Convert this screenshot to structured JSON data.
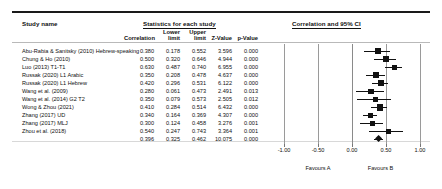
{
  "headings": {
    "study_name": "Study name",
    "statistics": "Statistics for each study",
    "forest": "Correlation and 95% CI"
  },
  "columns": {
    "correlation": "Correlation",
    "lower_line1": "Lower",
    "lower_line2": "limit",
    "upper_line1": "Upper",
    "upper_line2": "limit",
    "z_value": "Z-Value",
    "p_value": "p-Value"
  },
  "rows": [
    {
      "name": "Abu-Rabia & Sanitsky (2010) Hebrew-speaking",
      "correlation": "0.380",
      "lower": "0.178",
      "upper": "0.552",
      "z": "3.596",
      "p": "0.000",
      "point": 0.38,
      "lo": 0.178,
      "hi": 0.552,
      "weight": 0.62
    },
    {
      "name": "Chung & Ho (2010)",
      "correlation": "0.500",
      "lower": "0.320",
      "upper": "0.646",
      "z": "4.944",
      "p": "0.000",
      "point": 0.5,
      "lo": 0.32,
      "hi": 0.646,
      "weight": 0.55
    },
    {
      "name": "Luo (2013) T1-T1",
      "correlation": "0.630",
      "lower": "0.487",
      "upper": "0.740",
      "z": "6.955",
      "p": "0.000",
      "point": 0.63,
      "lo": 0.487,
      "hi": 0.74,
      "weight": 0.5
    },
    {
      "name": "Russak (2020) L1 Arabic",
      "correlation": "0.350",
      "lower": "0.208",
      "upper": "0.478",
      "z": "4.637",
      "p": "0.000",
      "point": 0.35,
      "lo": 0.208,
      "hi": 0.478,
      "weight": 0.78
    },
    {
      "name": "Russak (2020) L1 Hebrew",
      "correlation": "0.420",
      "lower": "0.296",
      "upper": "0.531",
      "z": "6.122",
      "p": "0.000",
      "point": 0.42,
      "lo": 0.296,
      "hi": 0.531,
      "weight": 0.85
    },
    {
      "name": "Wang et al. (2009)",
      "correlation": "0.280",
      "lower": "0.061",
      "upper": "0.473",
      "z": "2.491",
      "p": "0.013",
      "point": 0.28,
      "lo": 0.061,
      "hi": 0.473,
      "weight": 0.55
    },
    {
      "name": "Wang et al. (2014) G2 T2",
      "correlation": "0.350",
      "lower": "0.079",
      "upper": "0.573",
      "z": "2.505",
      "p": "0.012",
      "point": 0.35,
      "lo": 0.079,
      "hi": 0.573,
      "weight": 0.48
    },
    {
      "name": "Wong & Zhou (2021)",
      "correlation": "0.410",
      "lower": "0.284",
      "upper": "0.514",
      "z": "6.432",
      "p": "0.000",
      "point": 0.41,
      "lo": 0.284,
      "hi": 0.514,
      "weight": 0.92
    },
    {
      "name": "Zhang (2017) UD",
      "correlation": "0.340",
      "lower": "0.164",
      "upper": "0.369",
      "z": "4.307",
      "p": "0.000",
      "point": 0.27,
      "lo": 0.164,
      "hi": 0.369,
      "weight": 0.72
    },
    {
      "name": "Zhang (2017) MLJ",
      "correlation": "0.300",
      "lower": "0.124",
      "upper": "0.458",
      "z": "3.276",
      "p": "0.001",
      "point": 0.3,
      "lo": 0.124,
      "hi": 0.458,
      "weight": 0.7
    },
    {
      "name": "Zhou et al. (2018)",
      "correlation": "0.540",
      "lower": "0.247",
      "upper": "0.743",
      "z": "3.364",
      "p": "0.001",
      "point": 0.54,
      "lo": 0.247,
      "hi": 0.743,
      "weight": 0.38
    },
    {
      "name": "",
      "correlation": "0.396",
      "lower": "0.325",
      "upper": "0.462",
      "z": "10.075",
      "p": "0.000",
      "point": 0.396,
      "lo": 0.325,
      "hi": 0.462,
      "summary": true
    }
  ],
  "axis": {
    "ticks": [
      "-1.00",
      "-0.50",
      "0.00",
      "0.50",
      "1.00"
    ],
    "tick_values": [
      -1,
      -0.5,
      0,
      0.5,
      1
    ],
    "min": -1,
    "max": 1
  },
  "favours": {
    "left": "Favours A",
    "right": "Favours B"
  },
  "chart_data": {
    "type": "forest",
    "title": "Correlation and 95% CI",
    "xlabel": "",
    "ylabel": "",
    "xlim": [
      -1,
      1
    ],
    "effect_measure": "Correlation",
    "categories": [
      "Abu-Rabia & Sanitsky (2010) Hebrew-speaking",
      "Chung & Ho (2010)",
      "Luo (2013) T1-T1",
      "Russak (2020) L1 Arabic",
      "Russak (2020) L1 Hebrew",
      "Wang et al. (2009)",
      "Wang et al. (2014) G2 T2",
      "Wong & Zhou (2021)",
      "Zhang (2017) UD",
      "Zhang (2017) MLJ",
      "Zhou et al. (2018)",
      "Summary"
    ],
    "values": [
      0.38,
      0.5,
      0.63,
      0.35,
      0.42,
      0.28,
      0.35,
      0.41,
      0.34,
      0.3,
      0.54,
      0.396
    ],
    "ci_lower": [
      0.178,
      0.32,
      0.487,
      0.208,
      0.296,
      0.061,
      0.079,
      0.284,
      0.164,
      0.124,
      0.247,
      0.325
    ],
    "ci_upper": [
      0.552,
      0.646,
      0.74,
      0.478,
      0.531,
      0.473,
      0.573,
      0.514,
      0.369,
      0.458,
      0.743,
      0.462
    ],
    "z_values": [
      3.596,
      4.944,
      6.955,
      4.637,
      6.122,
      2.491,
      2.505,
      6.432,
      4.307,
      3.276,
      3.364,
      10.075
    ],
    "p_values": [
      0.0,
      0.0,
      0.0,
      0.0,
      0.0,
      0.013,
      0.012,
      0.0,
      0.0,
      0.001,
      0.001,
      0.0
    ],
    "reference_line": 0,
    "grid": false,
    "legend": "none"
  }
}
